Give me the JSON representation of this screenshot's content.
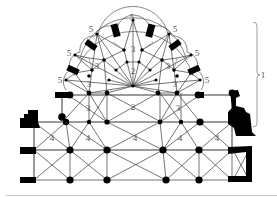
{
  "figure": {
    "colors": {
      "ink": "#000000",
      "ribs": "#3a3a3a",
      "labels": "#555555",
      "background": "#ffffff"
    }
  },
  "labels": {
    "l5_top": "5",
    "l5_ul": "5",
    "l5_ur": "5",
    "l5_ml": "5",
    "l5_mr": "5",
    "l5_ll": "5",
    "l5_lr": "5",
    "l3_top": "3",
    "l3_ul": "3",
    "l3_ur": "3",
    "l3_ml": "3",
    "l3_mr": "3",
    "l3_ll": "3",
    "l3_lr": "3",
    "l2_apse": "2",
    "l2_choir": "2",
    "l4_1": "4",
    "l4_2": "4",
    "l4_3": "4",
    "l4_4": "4",
    "l4_5": "4",
    "l1_bracket": "1"
  },
  "legend_note": {
    "1": "choir extent (bracket)",
    "2": "main vessel vaults",
    "3": "ambulatory vaults",
    "4": "aisle / transept bays",
    "5": "radiating chapels"
  }
}
